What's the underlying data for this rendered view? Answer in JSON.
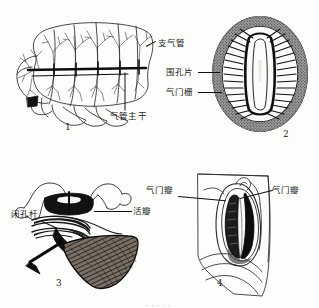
{
  "figure": {
    "kind": "scanned-biology-plate",
    "background_color": "#fdfdfc",
    "ink_color": "#111111",
    "panel_count": 4
  },
  "panels": [
    {
      "number": "1",
      "name": "whole-body-tracheal-system",
      "description": "Lateral view of insect body showing branching tracheal system",
      "labels": [
        {
          "id": "bronchus",
          "text": "支气管"
        },
        {
          "id": "main-trachea",
          "text": "气管主干"
        }
      ]
    },
    {
      "number": "2",
      "name": "spiracle-cross-section",
      "description": "Oval spiracle with peritreme and sieve plate, dark stippled ring",
      "labels": [
        {
          "id": "peritreme",
          "text": "围孔片"
        },
        {
          "id": "spiracle-sieve",
          "text": "气门栅"
        }
      ]
    },
    {
      "number": "3",
      "name": "spiracle-closing-apparatus",
      "description": "Sectional view of spiracle closing mechanism with muscle",
      "labels": [
        {
          "id": "closing-lever",
          "text": "闭孔杆"
        },
        {
          "id": "valve",
          "text": "活瓣"
        }
      ]
    },
    {
      "number": "4",
      "name": "spiracle-external-view",
      "description": "External surface view of spiracle with two valve lips",
      "labels": [
        {
          "id": "spiracle-valve-left",
          "text": "气门瓣"
        },
        {
          "id": "spiracle-valve-right",
          "text": "气门瓣"
        }
      ]
    }
  ],
  "caption_strip": "·····"
}
